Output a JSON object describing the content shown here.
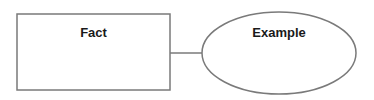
{
  "diagram": {
    "nodes": [
      {
        "id": "fact",
        "shape": "rectangle",
        "label": "Fact"
      },
      {
        "id": "example",
        "shape": "ellipse",
        "label": "Example"
      }
    ],
    "edges": [
      {
        "from": "fact",
        "to": "example"
      }
    ],
    "colors": {
      "stroke": "#7a7a7a",
      "fill": "#ffffff",
      "text": "#1a1a1a"
    }
  }
}
